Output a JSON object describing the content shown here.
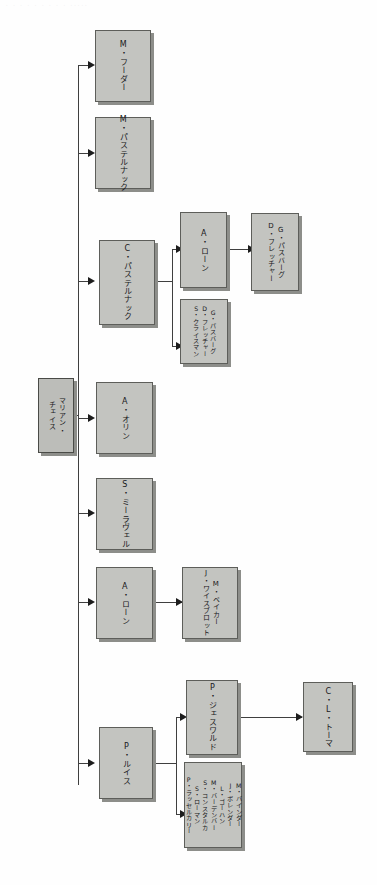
{
  "meta": {
    "header_strip_text": "· · ·   ·  ·   ·   · ·   ·    ·····"
  },
  "diagram": {
    "type": "org-tree",
    "orientation": "left-to-right-rotated",
    "root": {
      "id": "root",
      "label": "マリアン・\nチェイス"
    },
    "nodes": [
      {
        "id": "m-fuhrer",
        "label": "M・フーダー"
      },
      {
        "id": "m-pasternack",
        "label": "M・パステルナック"
      },
      {
        "id": "c-pasternack",
        "label": "C・パステルナック"
      },
      {
        "id": "a-lawn-1",
        "label": "A・ローン"
      },
      {
        "id": "g-passburg-2",
        "label": "G・パスバーグ\nD・フレッチャー"
      },
      {
        "id": "g-passburg-3",
        "label": "G・パスバーグ\nD・フレッチャー\nS・クライスマン"
      },
      {
        "id": "a-orin",
        "label": "A・オリン"
      },
      {
        "id": "s-miraveru",
        "label": "S・ミーラヴェル"
      },
      {
        "id": "a-lawn-2",
        "label": "A・ローン"
      },
      {
        "id": "m-baker",
        "label": "M・ベイカー\nJ・ワイスブロット"
      },
      {
        "id": "p-lewis",
        "label": "P・ルイス"
      },
      {
        "id": "p-jesworld",
        "label": "P・ジェスワルド"
      },
      {
        "id": "c-l-toma",
        "label": "C・L・トーマ"
      },
      {
        "id": "staff-list",
        "label": "M・バインダー\nJ・ボレンダー\nL・ゴーハン\nM・バーデンバー\nS・コンスタルカ\nS・ローマン\nP・ラッセルカリー"
      }
    ],
    "edges": [
      {
        "from": "root",
        "to": "m-fuhrer"
      },
      {
        "from": "root",
        "to": "m-pasternack"
      },
      {
        "from": "root",
        "to": "c-pasternack"
      },
      {
        "from": "root",
        "to": "a-orin"
      },
      {
        "from": "root",
        "to": "s-miraveru"
      },
      {
        "from": "root",
        "to": "a-lawn-2"
      },
      {
        "from": "root",
        "to": "p-lewis"
      },
      {
        "from": "c-pasternack",
        "to": "a-lawn-1"
      },
      {
        "from": "c-pasternack",
        "to": "g-passburg-3"
      },
      {
        "from": "a-lawn-1",
        "to": "g-passburg-2"
      },
      {
        "from": "a-lawn-2",
        "to": "m-baker"
      },
      {
        "from": "p-lewis",
        "to": "p-jesworld"
      },
      {
        "from": "p-lewis",
        "to": "staff-list"
      },
      {
        "from": "p-jesworld",
        "to": "c-l-toma"
      }
    ]
  },
  "colors": {
    "box_fill": "#c3c4c0",
    "box_border": "#5d5e5a",
    "box_shadow": "#8d8e8a",
    "line": "#3f3f3f",
    "text": "#17171a",
    "background": "#fefefe"
  }
}
